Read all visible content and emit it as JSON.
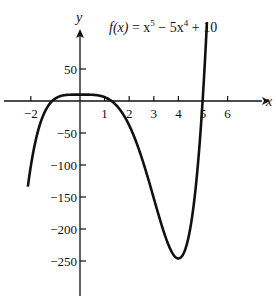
{
  "chart_data": {
    "type": "line",
    "title_parts": {
      "fx": "f(x)",
      "eq": " = x",
      "exp1": "5",
      "mid": " − 5x",
      "exp2": "4",
      "tail": " + 10"
    },
    "xlabel": "x",
    "ylabel": "y",
    "xlim": [
      -2.6,
      7.0
    ],
    "ylim": [
      -300,
      100
    ],
    "x_ticks": [
      -2,
      1,
      2,
      3,
      4,
      5,
      6
    ],
    "x_tick_labels": [
      "−2",
      "1",
      "2",
      "3",
      "4",
      "5",
      "6"
    ],
    "y_ticks": [
      50,
      -50,
      -100,
      -150,
      -200,
      -250
    ],
    "y_tick_labels": [
      "50",
      "−50",
      "−100",
      "−150",
      "−200",
      "−250"
    ],
    "grid": false,
    "series": [
      {
        "name": "f(x) = x^5 − 5x^4 + 10",
        "function": "x^5 - 5*x^4 + 10",
        "x_range": [
          -2.12,
          5.16
        ],
        "key_points": [
          {
            "x": -1.27,
            "y": 0,
            "label": "root"
          },
          {
            "x": 0,
            "y": 10,
            "label": "local max"
          },
          {
            "x": 1.08,
            "y": 0,
            "label": "root"
          },
          {
            "x": 4,
            "y": -246,
            "label": "local min"
          },
          {
            "x": 5.0,
            "y": 0,
            "label": "root"
          }
        ]
      }
    ]
  }
}
